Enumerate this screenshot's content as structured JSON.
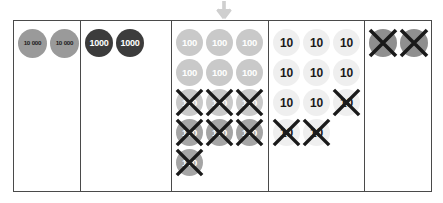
{
  "diagram": {
    "arrow": {
      "icon": "arrow-down-icon",
      "color": "#cfcfcf"
    }
  },
  "colors": {
    "table_border": "#4a4a4a",
    "chip_ten_thousand": "#9a9a9a",
    "chip_thousand": "#3c3c3c",
    "chip_hundred_light": "#c9c9c9",
    "chip_hundred_dark": "#a5a5a5",
    "chip_ten": "#efefef",
    "chip_unit": "#8f8f8f",
    "cross_mark": "#1a1a1a"
  },
  "columns": [
    {
      "name": "ten-thousands",
      "width_class": "col-w1",
      "chip_class": "chip-tenk",
      "rows": [
        [
          {
            "label": "10 000",
            "crossed": false
          },
          {
            "label": "10 000",
            "crossed": false
          }
        ]
      ]
    },
    {
      "name": "thousands",
      "width_class": "col-w2",
      "chip_class": "chip-k",
      "rows": [
        [
          {
            "label": "1000",
            "crossed": false
          },
          {
            "label": "1000",
            "crossed": false
          }
        ]
      ]
    },
    {
      "name": "hundreds",
      "width_class": "col-w3",
      "chip_class": "chip-h",
      "rows": [
        [
          {
            "label": "100",
            "crossed": false
          },
          {
            "label": "100",
            "crossed": false
          },
          {
            "label": "100",
            "crossed": false
          }
        ],
        [
          {
            "label": "100",
            "crossed": false
          },
          {
            "label": "100",
            "crossed": false
          },
          {
            "label": "100",
            "crossed": false
          }
        ],
        [
          {
            "label": "100",
            "crossed": true
          },
          {
            "label": "100",
            "crossed": true
          },
          {
            "label": "100",
            "crossed": true
          }
        ],
        [
          {
            "label": "100",
            "crossed": true,
            "shade": "dark"
          },
          {
            "label": "100",
            "crossed": true,
            "shade": "dark"
          },
          {
            "label": "100",
            "crossed": true,
            "shade": "dark"
          }
        ],
        [
          {
            "label": "100",
            "crossed": true,
            "shade": "dark"
          }
        ]
      ]
    },
    {
      "name": "tens",
      "width_class": "col-w4",
      "chip_class": "chip-t",
      "rows": [
        [
          {
            "label": "10",
            "crossed": false
          },
          {
            "label": "10",
            "crossed": false
          },
          {
            "label": "10",
            "crossed": false
          }
        ],
        [
          {
            "label": "10",
            "crossed": false
          },
          {
            "label": "10",
            "crossed": false
          },
          {
            "label": "10",
            "crossed": false
          }
        ],
        [
          {
            "label": "10",
            "crossed": false
          },
          {
            "label": "10",
            "crossed": false
          },
          {
            "label": "10",
            "crossed": true
          }
        ],
        [
          {
            "label": "10",
            "crossed": true
          },
          {
            "label": "10",
            "crossed": true
          }
        ]
      ]
    },
    {
      "name": "ones",
      "width_class": "col-w5",
      "chip_class": "chip-u",
      "rows": [
        [
          {
            "label": "",
            "crossed": true
          },
          {
            "label": "",
            "crossed": true
          }
        ]
      ]
    }
  ],
  "counts": {
    "ten_thousands_total": 2,
    "thousands_total": 2,
    "hundreds_total": 13,
    "hundreds_crossed": 7,
    "tens_total": 11,
    "tens_crossed": 3,
    "ones_total": 2,
    "ones_crossed": 2
  }
}
